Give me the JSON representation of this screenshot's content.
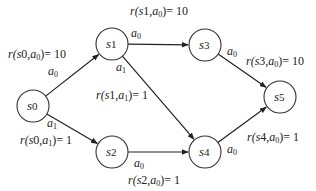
{
  "diagram": {
    "type": "mdp-state-graph",
    "nodes": [
      {
        "id": "s0",
        "base": "s",
        "sub": "0",
        "x": 33,
        "y": 106
      },
      {
        "id": "s1",
        "base": "s",
        "sub": "1",
        "x": 112,
        "y": 44
      },
      {
        "id": "s2",
        "base": "s",
        "sub": "2",
        "x": 112,
        "y": 152
      },
      {
        "id": "s3",
        "base": "s",
        "sub": "3",
        "x": 205,
        "y": 45
      },
      {
        "id": "s4",
        "base": "s",
        "sub": "4",
        "x": 205,
        "y": 152
      },
      {
        "id": "s5",
        "base": "s",
        "sub": "5",
        "x": 280,
        "y": 97
      }
    ],
    "node_radius": 16,
    "edges": [
      {
        "from": "s0",
        "to": "s1",
        "action": "a0",
        "action_base": "a",
        "action_sub": "0",
        "action_pos": [
          48,
          75
        ],
        "reward_text": "r(s0,a0)= 10",
        "reward_state": "0",
        "reward_action": "0",
        "reward_value": "10",
        "reward_pos": [
          8,
          58
        ]
      },
      {
        "from": "s0",
        "to": "s2",
        "action": "a1",
        "action_base": "a",
        "action_sub": "1",
        "action_pos": [
          47,
          127
        ],
        "reward_text": "r(s0,a1)= 1",
        "reward_state": "0",
        "reward_action": "1",
        "reward_value": "1",
        "reward_pos": [
          20,
          144
        ]
      },
      {
        "from": "s1",
        "to": "s3",
        "action": "a0",
        "action_base": "a",
        "action_sub": "0",
        "action_pos": [
          131,
          37
        ],
        "reward_text": "r(s1,a0)= 10",
        "reward_state": "1",
        "reward_action": "0",
        "reward_value": "10",
        "reward_pos": [
          130,
          15
        ]
      },
      {
        "from": "s1",
        "to": "s4",
        "action": "a1",
        "action_base": "a",
        "action_sub": "1",
        "action_pos": [
          116,
          71
        ],
        "reward_text": "r(s1,a1)= 1",
        "reward_state": "1",
        "reward_action": "1",
        "reward_value": "1",
        "reward_pos": [
          96,
          99
        ]
      },
      {
        "from": "s2",
        "to": "s4",
        "action": "a0",
        "action_base": "a",
        "action_sub": "0",
        "action_pos": [
          134,
          167
        ],
        "reward_text": "r(s2,a0)= 1",
        "reward_state": "2",
        "reward_action": "0",
        "reward_value": "1",
        "reward_pos": [
          128,
          184
        ]
      },
      {
        "from": "s3",
        "to": "s5",
        "action": "a0",
        "action_base": "a",
        "action_sub": "0",
        "action_pos": [
          227,
          55
        ],
        "reward_text": "r(s3,a0)= 10",
        "reward_state": "3",
        "reward_action": "0",
        "reward_value": "10",
        "reward_pos": [
          246,
          65
        ]
      },
      {
        "from": "s4",
        "to": "s5",
        "action": "a0",
        "action_base": "a",
        "action_sub": "0",
        "action_pos": [
          227,
          153
        ],
        "reward_text": "r(s4,a0)= 1",
        "reward_state": "4",
        "reward_action": "0",
        "reward_value": "1",
        "reward_pos": [
          247,
          141
        ]
      }
    ],
    "colors": {
      "stroke": "#222222",
      "node_fill": "#ffffff",
      "text": "#222222"
    }
  }
}
